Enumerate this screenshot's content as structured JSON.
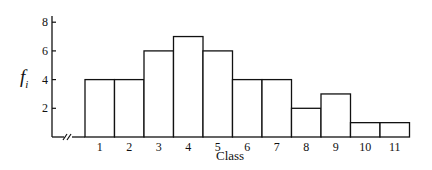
{
  "chart_data": {
    "type": "bar",
    "title": "",
    "xlabel": "Class",
    "ylabel": "f_i",
    "ylabel_main": "f",
    "ylabel_sub": "i",
    "categories": [
      "1",
      "2",
      "3",
      "4",
      "5",
      "6",
      "7",
      "8",
      "9",
      "10",
      "11"
    ],
    "values": [
      4,
      4,
      6,
      7,
      6,
      4,
      4,
      2,
      3,
      1,
      1
    ],
    "ylim": [
      0,
      8.5
    ],
    "yticks": [
      2,
      4,
      6,
      8
    ],
    "grid": false,
    "legend": null,
    "axis_break": true,
    "style": "histogram, unfilled bars with black outlines, adjacent bars"
  },
  "colors": {
    "line": "#111111",
    "fill": "#ffffff"
  }
}
